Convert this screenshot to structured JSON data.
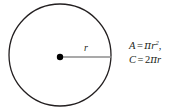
{
  "figure": {
    "background_color": "#ffffff",
    "stroke_color": "#231f20",
    "radius_line_color": "#8c8c8c",
    "center_dot_color": "#000000",
    "circle": {
      "center_x": 60,
      "center_y": 55,
      "radius": 51,
      "stroke_width": 1.3
    },
    "center_point": {
      "x": 60,
      "y": 57,
      "dot_radius": 3.2
    },
    "radius_line": {
      "x1": 60,
      "y1": 57,
      "x2": 112,
      "y2": 57,
      "stroke_width": 1.4
    },
    "radius_label": "r"
  },
  "formulas": {
    "area": {
      "lhs": "A",
      "equals": "=",
      "pi": "π",
      "variable": "r",
      "exponent": "2",
      "trailing_punctuation": ",",
      "plain_text": "A = πr²,"
    },
    "circumference": {
      "lhs": "C",
      "equals": "=",
      "coefficient": "2",
      "pi": "π",
      "variable": "r",
      "plain_text": "C = 2πr"
    }
  }
}
